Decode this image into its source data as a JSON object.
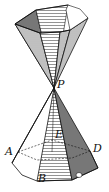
{
  "figure": {
    "type": "double-cone pyramid diagram",
    "labels": {
      "apex": "P",
      "a": "A",
      "b": "B",
      "d": "D",
      "e": "E"
    },
    "colors": {
      "ink": "#111111",
      "shade_light": "#cfcfcf",
      "shade_mid": "#a8a8a8",
      "shade_dark": "#6e6e6e",
      "background": "#ffffff"
    }
  }
}
